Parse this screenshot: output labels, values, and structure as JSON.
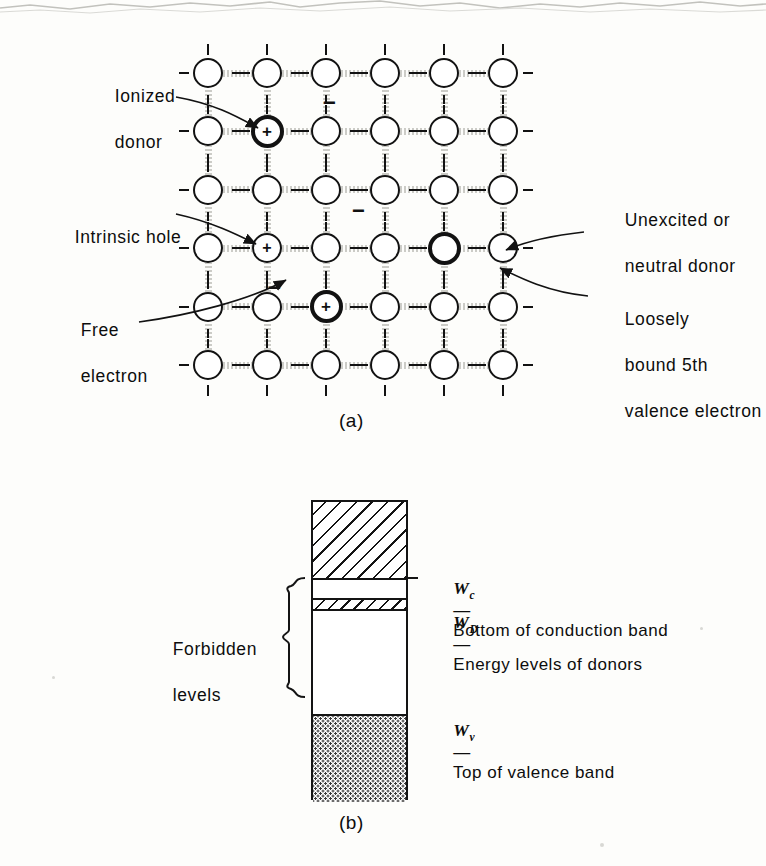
{
  "figure": {
    "panel_a_caption": "(a)",
    "panel_b_caption": "(b)"
  },
  "lattice": {
    "rows": 6,
    "cols": 6,
    "annotations": {
      "ionized_donor": "Ionized\ndonor",
      "ionized_donor_line1": "Ionized",
      "ionized_donor_line2": "donor",
      "intrinsic_hole": "Intrinsic hole",
      "free_electron_line1": "Free",
      "free_electron_line2": "electron",
      "neutral_donor_line1": "Unexcited or",
      "neutral_donor_line2": "neutral donor",
      "loose_electron_line1": "Loosely",
      "loose_electron_line2": "bound 5th",
      "loose_electron_line3": "valence electron"
    },
    "charge_symbols": {
      "positive": "+",
      "negative": "−"
    },
    "sites": [
      {
        "id": "ionized-donor-atom",
        "row": 2,
        "col": 2,
        "style": "bold",
        "charge": "+"
      },
      {
        "id": "intrinsic-hole-atom",
        "row": 4,
        "col": 2,
        "style": "thin",
        "charge": "+"
      },
      {
        "id": "ionized-donor-atom-2",
        "row": 5,
        "col": 3,
        "style": "bold",
        "charge": "+"
      },
      {
        "id": "neutral-donor-atom",
        "row": 4,
        "col": 5,
        "style": "bold",
        "charge": ""
      }
    ],
    "free_charges": [
      {
        "id": "free-minus-top",
        "symbol": "−"
      },
      {
        "id": "free-minus-middle",
        "symbol": "−"
      },
      {
        "id": "free-minus-electron",
        "symbol": "−"
      }
    ]
  },
  "band_diagram": {
    "forbidden_label_line1": "Forbidden",
    "forbidden_label_line2": "levels",
    "levels": [
      {
        "id": "conduction-band",
        "symbol": "W",
        "subscript": "c",
        "dash": "—",
        "text": "Bottom of conduction band"
      },
      {
        "id": "donor-level",
        "symbol": "W",
        "subscript": "D",
        "dash": "—",
        "text": "Energy levels of donors"
      },
      {
        "id": "valence-band",
        "symbol": "W",
        "subscript": "v",
        "dash": "—",
        "text": "Top of valence band"
      }
    ]
  },
  "colors": {
    "ink": "#121212",
    "bond": "#c9c9c4",
    "paper": "#fdfdfb",
    "stipple": "#3a3a3a"
  }
}
